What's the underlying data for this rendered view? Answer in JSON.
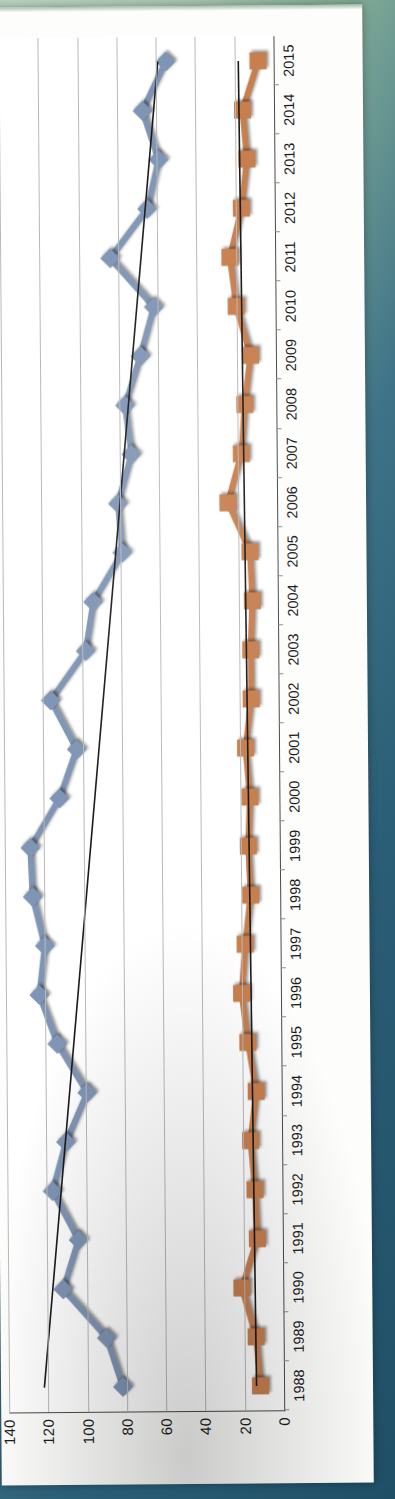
{
  "figure": {
    "orientation": "rotated-90-ccw",
    "paper_color": "#fdfdfb",
    "background_colors": [
      "#a8c6b2",
      "#2e6378"
    ]
  },
  "chart_data": {
    "type": "line",
    "title": "",
    "subtitle": "",
    "xlabel": "",
    "ylabel": "",
    "grid": true,
    "legend": "none",
    "ylim": [
      0,
      140
    ],
    "yticks": [
      0,
      20,
      40,
      60,
      80,
      100,
      120,
      140
    ],
    "categories": [
      "1988",
      "1989",
      "1990",
      "1991",
      "1992",
      "1993",
      "1994",
      "1995",
      "1996",
      "1997",
      "1998",
      "1999",
      "2000",
      "2001",
      "2002",
      "2003",
      "2004",
      "2005",
      "2006",
      "2007",
      "2008",
      "2009",
      "2010",
      "2011",
      "2012",
      "2013",
      "2014",
      "2015"
    ],
    "series": [
      {
        "name": "Series 1",
        "color": "#7f95b5",
        "marker": "diamond",
        "values": [
          82,
          90,
          112,
          104,
          117,
          110,
          99,
          114,
          123,
          120,
          126,
          127,
          112,
          103,
          116,
          98,
          94,
          79,
          81,
          74,
          77,
          69,
          62,
          84,
          65,
          59,
          67,
          55
        ]
      },
      {
        "name": "Series 2",
        "color": "#c87f4e",
        "marker": "square",
        "values": [
          12,
          14,
          21,
          13,
          14,
          16,
          13,
          17,
          20,
          18,
          15,
          16,
          15,
          17,
          14,
          14,
          13,
          14,
          25,
          18,
          16,
          13,
          20,
          23,
          17,
          14,
          16,
          8
        ]
      }
    ],
    "trendlines": [
      {
        "name": "Series 1 trendline",
        "color": "#1a1a1a",
        "start": {
          "x": "1988",
          "y": 122
        },
        "end": {
          "x": "2015",
          "y": 59
        }
      },
      {
        "name": "Series 2 trendline",
        "color": "#1a1a1a",
        "start": {
          "x": "1988",
          "y": 14
        },
        "end": {
          "x": "2015",
          "y": 18
        }
      }
    ]
  }
}
